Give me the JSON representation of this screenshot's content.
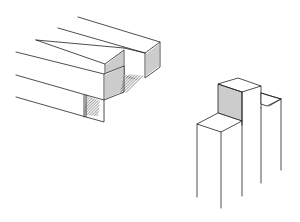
{
  "illustration": {
    "subject": "woodworking joint line drawing",
    "left_group": {
      "label": "parallel square timbers with end grain, left"
    },
    "right_group": {
      "label": "vertical posts with raised block, right"
    },
    "colors": {
      "ink": "#222222",
      "background": "#ffffff"
    }
  }
}
